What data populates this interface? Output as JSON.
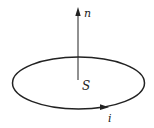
{
  "diagram": {
    "labels": {
      "normal": "n",
      "surface": "S",
      "current": "i"
    },
    "colors": {
      "stroke": "#222222",
      "background": "#ffffff"
    }
  }
}
